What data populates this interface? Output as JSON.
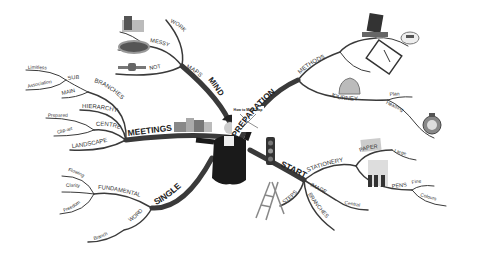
{
  "title": "How to Mind Map",
  "center": {
    "label": "How to Mind Map",
    "figure": "person-in-hat",
    "props": [
      "traffic-light",
      "city-skyline"
    ]
  },
  "branches": [
    {
      "label": "MIND",
      "children": [
        {
          "label": "MAPS",
          "children": [
            {
              "label": "WORK"
            },
            {
              "label": "MESSY",
              "children": []
            },
            {
              "label": "NOT"
            }
          ]
        }
      ],
      "images": [
        "thumbs-down",
        "cloud-badge",
        "pen-tool"
      ]
    },
    {
      "label": "PREPARATION",
      "children": [
        {
          "label": "METHODS",
          "images": [
            "laptop",
            "notebook",
            "mouse"
          ]
        },
        {
          "label": "JOURNEY",
          "children": [
            {
              "label": "Plan"
            },
            {
              "label": "Heading"
            }
          ],
          "images": [
            "helmet",
            "compass"
          ]
        }
      ]
    },
    {
      "label": "MEETINGS",
      "children": [
        {
          "label": "BRANCHES",
          "children": [
            {
              "label": "SUB",
              "children": [
                {
                  "label": "Limitless"
                },
                {
                  "label": "Association"
                }
              ]
            },
            {
              "label": "MAIN"
            }
          ]
        },
        {
          "label": "HIERARCHY"
        },
        {
          "label": "CENTRE",
          "children": [
            {
              "label": "Prepared"
            },
            {
              "label": "Clip-art"
            }
          ]
        },
        {
          "label": "LANDSCAPE"
        }
      ]
    },
    {
      "label": "SINGLE",
      "children": [
        {
          "label": "FUNDAMENTAL",
          "children": [
            {
              "label": "Flowing"
            },
            {
              "label": "Clarity"
            },
            {
              "label": "Freedom"
            }
          ]
        },
        {
          "label": "WORD",
          "children": [
            {
              "label": "Branch"
            }
          ]
        }
      ]
    },
    {
      "label": "START",
      "children": [
        {
          "label": "STATIONERY",
          "children": [
            {
              "label": "PAPER",
              "children": [
                {
                  "label": "Large"
                }
              ]
            },
            {
              "label": "PENS",
              "children": [
                {
                  "label": "Fine"
                },
                {
                  "label": "Colours"
                }
              ]
            }
          ]
        },
        {
          "label": "IMAGE",
          "children": [
            {
              "label": "Central"
            }
          ]
        },
        {
          "label": "STEPS",
          "images": [
            "ladder"
          ]
        },
        {
          "label": "BRANCHES"
        }
      ]
    }
  ],
  "labels": {
    "mind": "MIND",
    "maps": "MAPS",
    "work": "WORK",
    "messy": "MESSY",
    "not": "NOT",
    "preparation": "PREPARATION",
    "methods": "METHODS",
    "journey": "JOURNEY",
    "plan": "Plan",
    "heading": "Heading",
    "meetings": "MEETINGS",
    "branches": "BRANCHES",
    "sub": "SUB",
    "limitless": "Limitless",
    "association": "Association",
    "main": "MAIN",
    "hierarchy": "HIERARCHY",
    "centre": "CENTRE",
    "prepared": "Prepared",
    "clipart": "Clip-art",
    "landscape": "LANDSCAPE",
    "single": "SINGLE",
    "fundamental": "FUNDAMENTAL",
    "flowing": "Flowing",
    "clarity": "Clarity",
    "freedom": "Freedom",
    "word": "WORD",
    "branch": "Branch",
    "start": "START",
    "stationery": "STATIONERY",
    "paper": "PAPER",
    "large": "Large",
    "pens": "PENS",
    "fine": "Fine",
    "colours": "Colours",
    "image": "IMAGE",
    "central": "Central",
    "steps": "STEPS",
    "branches2": "BRANCHES",
    "center_sign": "How to Mind Map"
  }
}
